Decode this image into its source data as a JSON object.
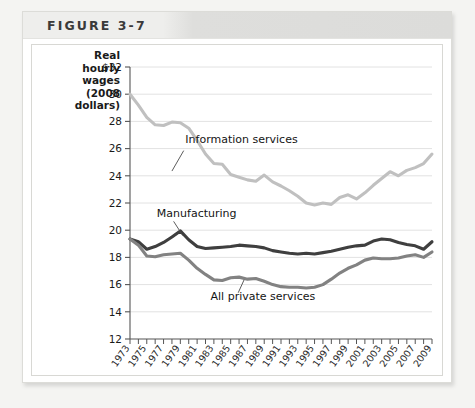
{
  "figure": {
    "title": "FIGURE 3-7"
  },
  "chart_data": {
    "type": "line",
    "title": "",
    "xlabel": "Year",
    "ylabel": "Real hourly wages (2008 dollars)",
    "ylabel_lines": [
      "Real",
      "hourly",
      "wages",
      "(2008",
      "dollars)"
    ],
    "ylim": [
      12,
      32
    ],
    "yticks": [
      12,
      14,
      16,
      18,
      20,
      22,
      24,
      26,
      28,
      30,
      32
    ],
    "ytick_labels": [
      "12",
      "14",
      "16",
      "18",
      "20",
      "22",
      "24",
      "26",
      "28",
      "30",
      "$32"
    ],
    "xlim": [
      1973,
      2009
    ],
    "x": [
      1973,
      1974,
      1975,
      1976,
      1977,
      1978,
      1979,
      1980,
      1981,
      1982,
      1983,
      1984,
      1985,
      1986,
      1987,
      1988,
      1989,
      1990,
      1991,
      1992,
      1993,
      1994,
      1995,
      1996,
      1997,
      1998,
      1999,
      2000,
      2001,
      2002,
      2003,
      2004,
      2005,
      2006,
      2007,
      2008,
      2009
    ],
    "xticks": [
      1973,
      1974,
      1975,
      1976,
      1977,
      1978,
      1979,
      1980,
      1981,
      1982,
      1983,
      1984,
      1985,
      1986,
      1987,
      1988,
      1989,
      1990,
      1991,
      1992,
      1993,
      1994,
      1995,
      1996,
      1997,
      1998,
      1999,
      2000,
      2001,
      2002,
      2003,
      2004,
      2005,
      2006,
      2007,
      2008,
      2009
    ],
    "xtick_labels": [
      "1973",
      "",
      "1975",
      "",
      "1977",
      "",
      "1979",
      "",
      "1981",
      "",
      "1983",
      "",
      "1985",
      "",
      "1987",
      "",
      "1989",
      "",
      "1991",
      "",
      "1993",
      "",
      "1995",
      "",
      "1997",
      "",
      "1999",
      "",
      "2001",
      "",
      "2003",
      "",
      "2005",
      "",
      "2007",
      "",
      "2009"
    ],
    "grid": "horizontal",
    "legend_position": "inline-annotations",
    "series": [
      {
        "name": "Information services",
        "color": "#c0c0c0",
        "label_x": 1979.6,
        "label_y": 26.4,
        "leader": [
          [
            1979.4,
            25.85
          ],
          [
            1978.0,
            24.35
          ]
        ],
        "values": [
          30.0,
          29.2,
          28.3,
          27.75,
          27.7,
          27.95,
          27.9,
          27.5,
          26.6,
          25.6,
          24.9,
          24.85,
          24.1,
          23.9,
          23.7,
          23.6,
          24.05,
          23.55,
          23.25,
          22.9,
          22.5,
          22.0,
          21.85,
          22.0,
          21.9,
          22.4,
          22.6,
          22.3,
          22.75,
          23.3,
          23.8,
          24.3,
          24.0,
          24.4,
          24.6,
          24.9,
          25.6
        ]
      },
      {
        "name": "Manufacturing",
        "color": "#3f3f3f",
        "label_x": 1976.2,
        "label_y": 21.0,
        "leader": [
          [
            1978.2,
            20.65
          ],
          [
            1979.3,
            19.6
          ]
        ],
        "values": [
          19.35,
          19.15,
          18.6,
          18.8,
          19.1,
          19.5,
          19.95,
          19.3,
          18.8,
          18.65,
          18.7,
          18.75,
          18.8,
          18.9,
          18.85,
          18.8,
          18.7,
          18.5,
          18.4,
          18.3,
          18.25,
          18.3,
          18.25,
          18.35,
          18.45,
          18.6,
          18.75,
          18.85,
          18.9,
          19.2,
          19.35,
          19.3,
          19.1,
          18.95,
          18.85,
          18.6,
          19.15
        ]
      },
      {
        "name": "All private services",
        "color": "#828282",
        "label_x": 1982.6,
        "label_y": 14.9,
        "leader": [
          [
            1985.9,
            15.4
          ],
          [
            1986.6,
            16.35
          ]
        ],
        "values": [
          19.35,
          18.9,
          18.1,
          18.05,
          18.2,
          18.25,
          18.3,
          17.8,
          17.2,
          16.75,
          16.35,
          16.3,
          16.5,
          16.55,
          16.4,
          16.45,
          16.25,
          16.0,
          15.85,
          15.8,
          15.8,
          15.75,
          15.8,
          16.0,
          16.4,
          16.85,
          17.2,
          17.45,
          17.8,
          17.95,
          17.9,
          17.9,
          17.95,
          18.1,
          18.2,
          18.0,
          18.4
        ]
      }
    ]
  }
}
